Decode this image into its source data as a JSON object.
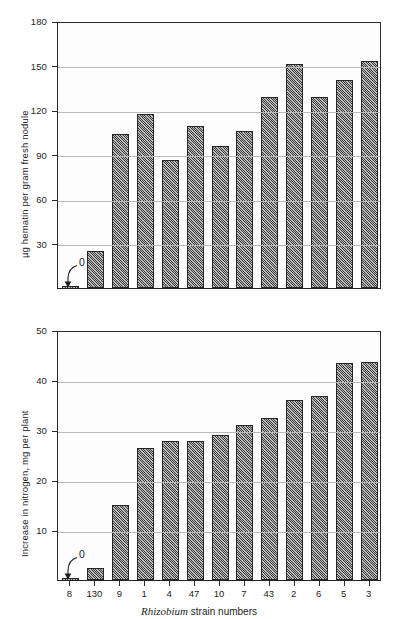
{
  "figure": {
    "categories": [
      "8",
      "130",
      "9",
      "1",
      "4",
      "47",
      "10",
      "7",
      "43",
      "2",
      "6",
      "5",
      "3"
    ],
    "xlabel_sci": "Rhizobium",
    "xlabel_rest": " strain numbers",
    "zero_annotation": "0"
  },
  "chart_data": [
    {
      "type": "bar",
      "title": "",
      "xlabel": "Rhizobium strain numbers",
      "ylabel": "µg hematin per gram fresh nodule",
      "categories": [
        "8",
        "130",
        "9",
        "1",
        "4",
        "47",
        "10",
        "7",
        "43",
        "2",
        "6",
        "5",
        "3"
      ],
      "values": [
        0,
        25,
        104,
        117,
        86,
        109,
        96,
        106,
        129,
        151,
        129,
        140,
        153
      ],
      "ylim": [
        0,
        180
      ],
      "yticks": [
        0,
        30,
        60,
        90,
        120,
        150,
        180
      ],
      "ytick_labels": [
        "",
        "30",
        "60",
        "90",
        "120",
        "150",
        "180"
      ],
      "grid": true,
      "legend": "none",
      "annotations": [
        {
          "text": "0",
          "target_category": "8",
          "note": "curved arrow pointing to zero-height bar"
        }
      ]
    },
    {
      "type": "bar",
      "title": "",
      "xlabel": "Rhizobium strain numbers",
      "ylabel": "Increase in nitrogen, mg per plant",
      "categories": [
        "8",
        "130",
        "9",
        "1",
        "4",
        "47",
        "10",
        "7",
        "43",
        "2",
        "6",
        "5",
        "3"
      ],
      "values": [
        0,
        2.5,
        15.0,
        26.5,
        27.8,
        27.8,
        29.0,
        31.0,
        32.5,
        36.1,
        36.8,
        43.5,
        43.7
      ],
      "ylim": [
        0,
        50
      ],
      "yticks": [
        0,
        10,
        20,
        30,
        40,
        50
      ],
      "ytick_labels": [
        "",
        "10",
        "20",
        "30",
        "40",
        "50"
      ],
      "grid": true,
      "legend": "none",
      "annotations": [
        {
          "text": "0",
          "target_category": "8",
          "note": "curved arrow pointing to zero-height bar"
        }
      ]
    }
  ]
}
